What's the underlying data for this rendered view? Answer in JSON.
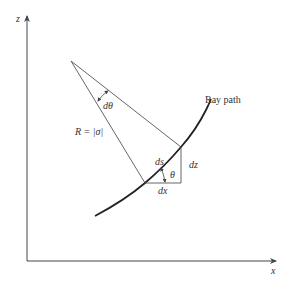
{
  "diagram": {
    "axes": {
      "x_label": "x",
      "z_label": "z"
    },
    "labels": {
      "ray_path": "Ray path",
      "radius": "R = |σ|",
      "dtheta": "dθ",
      "ds": "ds",
      "dz": "dz",
      "dx": "dx",
      "theta": "θ"
    },
    "colors": {
      "line": "#444444",
      "curve": "#222222",
      "background": "#ffffff"
    }
  }
}
